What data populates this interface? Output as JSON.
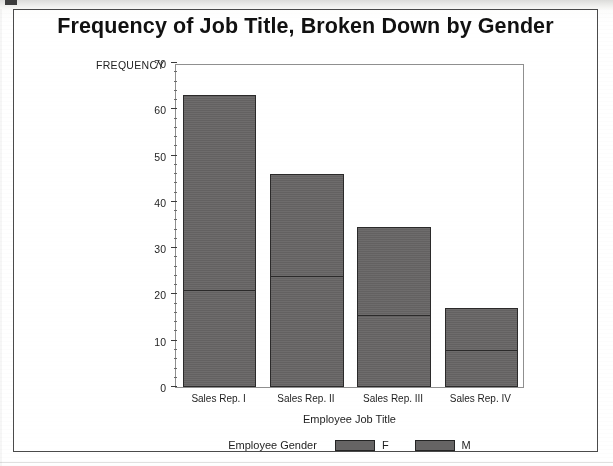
{
  "chart_data": {
    "type": "bar",
    "title": "Frequency of Job Title, Broken Down by Gender",
    "xlabel": "Employee Job Title",
    "ylabel": "FREQUENCY",
    "stacked": true,
    "orientation": "vertical",
    "grid": false,
    "legend_position": "bottom",
    "legend_title": "Employee Gender",
    "categories": [
      "Sales Rep. I",
      "Sales Rep. II",
      "Sales Rep. III",
      "Sales Rep. IV"
    ],
    "ylim": [
      0,
      70
    ],
    "ytick_step": 10,
    "yminor_step": 2,
    "ytick_labels": [
      "0",
      "10",
      "20",
      "30",
      "40",
      "50",
      "60",
      "70"
    ],
    "series": [
      {
        "name": "F",
        "color": "#666464",
        "values": [
          21,
          24,
          15.5,
          8
        ]
      },
      {
        "name": "M",
        "color": "#666464",
        "values": [
          42,
          22,
          19,
          9
        ]
      }
    ],
    "totals": [
      63,
      46,
      34.5,
      17
    ]
  },
  "colors": {
    "bar_fill": "#666464",
    "bar_border": "#2b2a2a",
    "axis": "#8f8f8f",
    "frame": "#4a4a4a",
    "text": "#1e1e1e"
  }
}
